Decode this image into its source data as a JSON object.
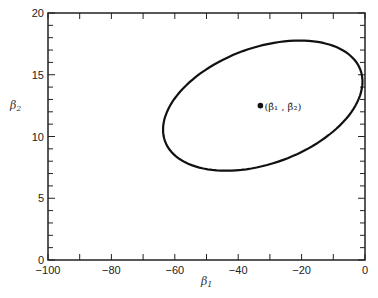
{
  "chart_data": {
    "type": "scatter",
    "title": "",
    "xlabel": "β1",
    "ylabel": "β2",
    "xlim": [
      -100,
      0
    ],
    "ylim": [
      0,
      20
    ],
    "grid": false,
    "x_ticks": [
      -100,
      -80,
      -60,
      -40,
      -20,
      0
    ],
    "x_tick_labels": [
      "−100",
      "−80",
      "−60",
      "−40",
      "−20",
      "0"
    ],
    "y_ticks": [
      0,
      5,
      10,
      15,
      20
    ],
    "y_tick_labels": [
      "0",
      "5",
      "10",
      "15",
      "20"
    ],
    "series": [
      {
        "name": "confidence ellipse",
        "kind": "ellipse",
        "extent": {
          "x_min": -63,
          "x_max": -1.5,
          "y_min": 7.2,
          "y_max": 17.8
        },
        "tilt": "positive correlation (rotated ~ +20°)"
      },
      {
        "name": "point estimate",
        "kind": "point",
        "x": -33,
        "y": 12.5,
        "label": "(β̂1, β̂2)"
      }
    ]
  },
  "labels": {
    "xlabel_main": "β",
    "xlabel_sub": "1",
    "ylabel_main": "β",
    "ylabel_sub": "2",
    "point_label": "(β̂₁ , β̂₂)"
  }
}
